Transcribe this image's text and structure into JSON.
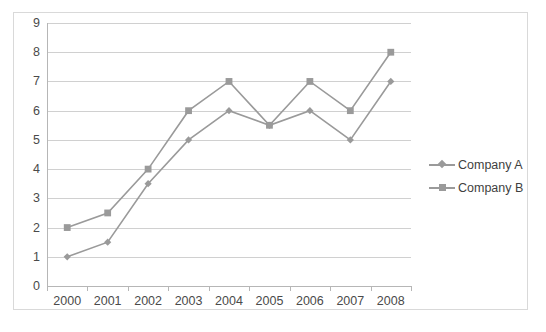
{
  "chart_data": {
    "type": "line",
    "title": "",
    "subtitle": "",
    "xlabel": "",
    "ylabel": "",
    "categories": [
      "2000",
      "2001",
      "2002",
      "2003",
      "2004",
      "2005",
      "2006",
      "2007",
      "2008"
    ],
    "series": [
      {
        "name": "Company A",
        "marker": "diamond",
        "color": "#9a9a9a",
        "values": [
          1,
          1.5,
          3.5,
          5,
          6,
          5.5,
          6,
          5,
          7
        ]
      },
      {
        "name": "Company B",
        "marker": "square",
        "color": "#9a9a9a",
        "values": [
          2,
          2.5,
          4,
          6,
          7,
          5.5,
          7,
          6,
          8
        ]
      }
    ],
    "ylim": [
      0,
      9
    ],
    "y_ticks": [
      0,
      1,
      2,
      3,
      4,
      5,
      6,
      7,
      8,
      9
    ],
    "grid": "horizontal",
    "legend_position": "right",
    "annotations": []
  },
  "legend": {
    "entries": [
      {
        "label": "Company A"
      },
      {
        "label": "Company B"
      }
    ]
  },
  "colors": {
    "series": "#9a9a9a",
    "gridline": "#d0d0d0",
    "axis": "#b6b6b6",
    "border": "#d9d9d9",
    "tick_text": "#4a4a4a",
    "legend_text": "#3f3f3f"
  }
}
